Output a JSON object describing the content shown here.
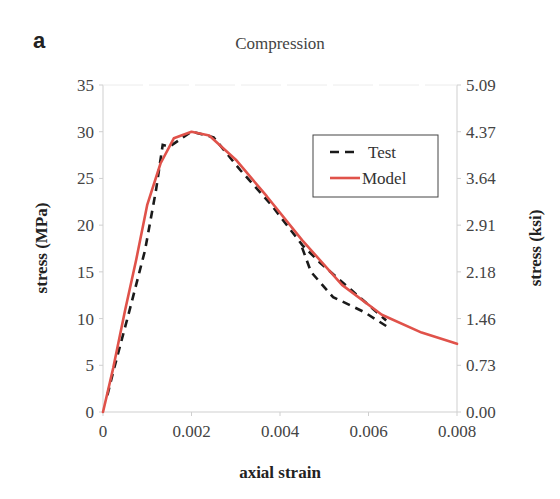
{
  "panel_label": "a",
  "chart_data": {
    "type": "line",
    "title": "Compression",
    "xlabel": "axial strain",
    "ylabel": "stress (MPa)",
    "ylabel_right": "stress (ksi)",
    "xlim": [
      0,
      0.008
    ],
    "ylim": [
      0,
      35
    ],
    "ylim_right": [
      0.0,
      5.09
    ],
    "x_ticks": [
      "0",
      "0.002",
      "0.004",
      "0.006",
      "0.008"
    ],
    "y_ticks": [
      "0",
      "5",
      "10",
      "15",
      "20",
      "25",
      "30",
      "35"
    ],
    "y_ticks_right": [
      "0.00",
      "0.73",
      "1.46",
      "2.18",
      "2.91",
      "3.64",
      "4.37",
      "5.09"
    ],
    "grid": false,
    "legend_position": "upper right",
    "legend": [
      "Test",
      "Model"
    ],
    "series": [
      {
        "name": "Test",
        "style": "dashed",
        "color": "#1a1a1a",
        "x": [
          0.0001,
          0.00023,
          0.0006,
          0.00095,
          0.0012,
          0.00135,
          0.0015,
          0.002,
          0.0025,
          0.0031,
          0.0038,
          0.0045,
          0.0049,
          0.0056,
          0.0064
        ],
        "y": [
          1.8,
          4.3,
          10.9,
          17.3,
          23.8,
          28.6,
          28.4,
          30.0,
          29.4,
          25.9,
          22.2,
          17.9,
          16.0,
          13.1,
          9.8
        ]
      },
      {
        "name": "Test (second specimen tail)",
        "style": "dashed",
        "color": "#1a1a1a",
        "x": [
          0.0045,
          0.0047,
          0.0052,
          0.0059,
          0.0064
        ],
        "y": [
          17.6,
          15.0,
          12.3,
          10.7,
          9.2
        ]
      },
      {
        "name": "Model",
        "style": "solid",
        "color": "#e0524a",
        "x": [
          0,
          0.00023,
          0.0005,
          0.00075,
          0.001,
          0.0013,
          0.0016,
          0.002,
          0.0024,
          0.003,
          0.0037,
          0.0045,
          0.0054,
          0.0063,
          0.0072,
          0.008
        ],
        "y": [
          0,
          4.7,
          10.9,
          16.3,
          22.2,
          26.6,
          29.3,
          30.0,
          29.6,
          27.0,
          23.1,
          18.4,
          13.6,
          10.4,
          8.5,
          7.3
        ]
      }
    ]
  }
}
